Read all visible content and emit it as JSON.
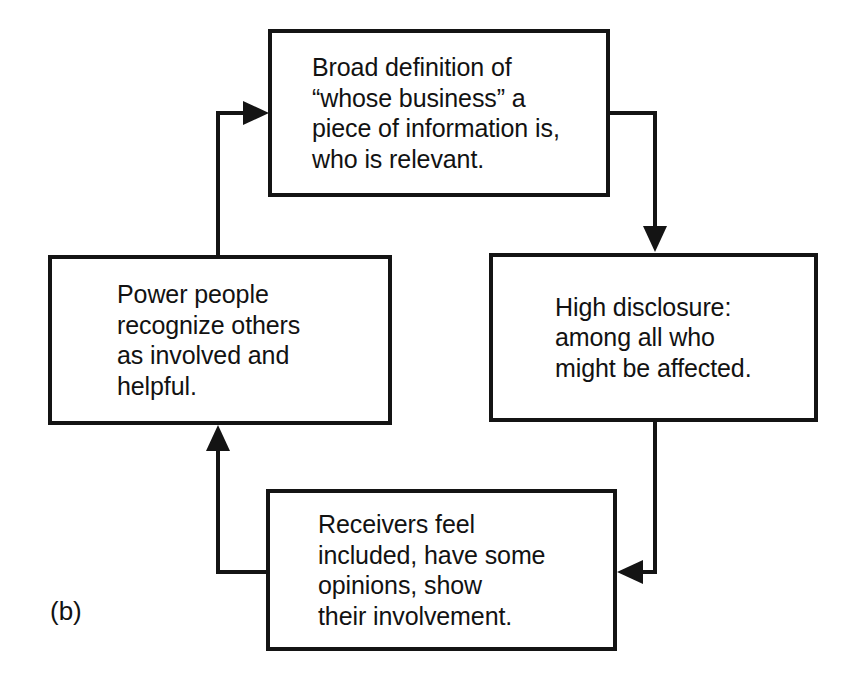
{
  "figure": {
    "label": "(b)",
    "type": "cycle-diagram",
    "line_color": "#141414",
    "text_color": "#121212",
    "background": "#ffffff"
  },
  "nodes": [
    {
      "id": "broad-definition",
      "position": "top",
      "text": "Broad definition of\n“whose business” a\npiece of information is,\nwho is relevant."
    },
    {
      "id": "high-disclosure",
      "position": "right",
      "text": "High disclosure:\namong all who\nmight be affected."
    },
    {
      "id": "receivers-feel-included",
      "position": "bottom",
      "text": "Receivers feel\nincluded, have some\nopinions, show\ntheir involvement."
    },
    {
      "id": "power-people-recognize",
      "position": "left",
      "text": "Power people\nrecognize others\nas involved and\nhelpful."
    }
  ],
  "connectors": [
    {
      "id": "top-to-right",
      "from": "broad-definition",
      "to": "high-disclosure",
      "direction": "down"
    },
    {
      "id": "right-to-bottom",
      "from": "high-disclosure",
      "to": "receivers-feel-included",
      "direction": "left"
    },
    {
      "id": "bottom-to-left",
      "from": "receivers-feel-included",
      "to": "power-people-recognize",
      "direction": "up"
    },
    {
      "id": "left-to-top",
      "from": "power-people-recognize",
      "to": "broad-definition",
      "direction": "right"
    }
  ]
}
